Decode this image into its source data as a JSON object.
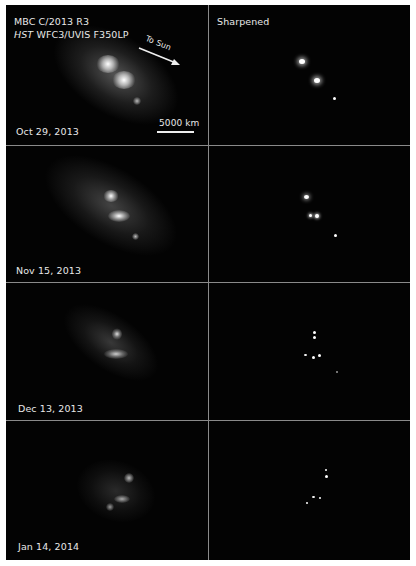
{
  "figure": {
    "title_line1": "MBC C/2013 R3",
    "title_line2_italic": "HST",
    "title_line2_rest": " WFC3/UVIS F350LP",
    "right_column_label": "Sharpened",
    "direction_label": "To Sun",
    "scale_label": "5000 km",
    "panels": [
      {
        "date": "Oct 29, 2013"
      },
      {
        "date": "Nov 15, 2013"
      },
      {
        "date": "Dec 13, 2013"
      },
      {
        "date": "Jan 14, 2014"
      }
    ]
  }
}
